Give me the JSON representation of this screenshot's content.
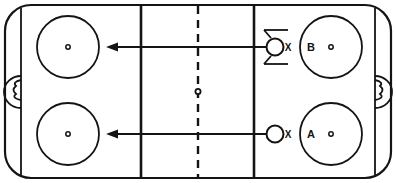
{
  "diagram": {
    "type": "ice-hockey-rink-schematic",
    "colors": {
      "line": "#141414",
      "ice": "#ffffff",
      "marker": "#141414"
    },
    "rink": {
      "board_outline": "rounded-rectangle",
      "corner_radius": 26,
      "boards_label": "rink-boards",
      "left_goal_line_label": "goal-line-left",
      "right_goal_line_label": "goal-line-right",
      "left_blue_line_label": "blue-line-left",
      "right_blue_line_label": "blue-line-right",
      "center_line_label": "center-line",
      "center_line_style": "dashed",
      "center_dot_label": "center-ice-dot"
    },
    "faceoff_circles": [
      {
        "id": "fo-left-top",
        "label": "",
        "position": "left-top",
        "cx": 68,
        "cy": 47,
        "r": 31
      },
      {
        "id": "fo-left-bottom",
        "label": "",
        "position": "left-bottom",
        "cx": 68,
        "cy": 134,
        "r": 31
      },
      {
        "id": "fo-right-top",
        "label": "B",
        "position": "right-top",
        "cx": 331,
        "cy": 47,
        "r": 31
      },
      {
        "id": "fo-right-bottom",
        "label": "A",
        "position": "right-bottom",
        "cx": 331,
        "cy": 134,
        "r": 31
      }
    ],
    "creases": [
      {
        "id": "crease-left",
        "side": "left"
      },
      {
        "id": "crease-right",
        "side": "right"
      }
    ],
    "players": [
      {
        "id": "player-b",
        "symbol": "circle",
        "label": "X",
        "annotation": "screen-bars",
        "cx": 277,
        "cy": 47,
        "r": 8
      },
      {
        "id": "player-a",
        "symbol": "circle",
        "label": "X",
        "annotation": "none",
        "cx": 277,
        "cy": 134,
        "r": 8
      }
    ],
    "arrows": [
      {
        "id": "arrow-top",
        "label": "movement-path-top",
        "from_x": 266,
        "to_x": 108,
        "y": 47,
        "direction": "left"
      },
      {
        "id": "arrow-bottom",
        "label": "movement-path-bottom",
        "from_x": 266,
        "to_x": 108,
        "y": 134,
        "direction": "left"
      }
    ]
  }
}
